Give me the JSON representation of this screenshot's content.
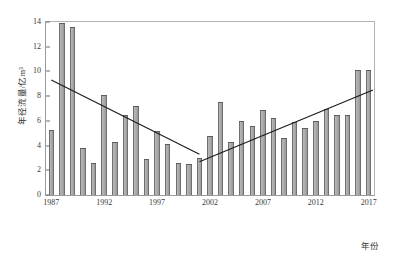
{
  "chart_data": {
    "type": "bar",
    "title": "",
    "subtitle": "",
    "xlabel": "年份",
    "ylabel": "年径流量/亿m³",
    "grid": false,
    "legend": "none",
    "ylim": [
      0,
      14
    ],
    "ytick_step": 2,
    "yticks": [
      0,
      2,
      4,
      6,
      8,
      10,
      12,
      14
    ],
    "xlim": [
      1986.5,
      2017.5
    ],
    "xticks": [
      1987,
      1992,
      1997,
      2002,
      2007,
      2012,
      2017
    ],
    "categories": [
      1987,
      1988,
      1989,
      1990,
      1991,
      1992,
      1993,
      1994,
      1995,
      1996,
      1997,
      1998,
      1999,
      2000,
      2001,
      2002,
      2003,
      2004,
      2005,
      2006,
      2007,
      2008,
      2009,
      2010,
      2011,
      2012,
      2013,
      2014,
      2015,
      2016,
      2017
    ],
    "series": [
      {
        "name": "年径流量",
        "units": "亿m³",
        "values": [
          5.3,
          13.9,
          13.6,
          3.8,
          2.6,
          8.1,
          4.3,
          6.5,
          7.2,
          2.9,
          5.2,
          4.1,
          2.6,
          2.5,
          3.0,
          4.8,
          7.5,
          4.3,
          6.0,
          5.6,
          6.9,
          6.2,
          4.6,
          5.9,
          5.4,
          6.0,
          7.0,
          6.5,
          6.5,
          10.1,
          10.1
        ]
      }
    ],
    "annotations": [
      {
        "kind": "trendline",
        "name": "declining-trend",
        "from": {
          "x": 1987.0,
          "y": 9.3
        },
        "to": {
          "x": 2001.0,
          "y": 3.3
        }
      },
      {
        "kind": "trendline",
        "name": "rising-trend",
        "from": {
          "x": 2001.0,
          "y": 2.7
        },
        "to": {
          "x": 2017.4,
          "y": 8.5
        }
      }
    ],
    "colors": {
      "bar_face": "#a8a8a8",
      "bar_edge": "#5d5d5d",
      "axis": "#6e6e6e",
      "frame": "#9a9a9a",
      "trendline": "#1a1a1a",
      "text": "#333333",
      "background": "#ffffff"
    }
  }
}
